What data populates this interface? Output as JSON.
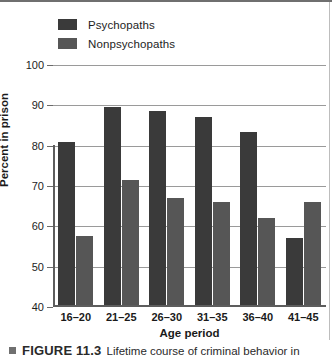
{
  "legend": {
    "items": [
      {
        "label": "Psychopaths",
        "color": "#3a3a3a",
        "icon": "legend-swatch-icon"
      },
      {
        "label": "Nonpsychopaths",
        "color": "#565656",
        "icon": "legend-swatch-icon"
      }
    ]
  },
  "caption": {
    "figure_number": "FIGURE 11.3",
    "text": "Lifetime course of criminal behavior in",
    "bullet_icon": "square-bullet-icon"
  },
  "chart_data": {
    "type": "bar",
    "title": "",
    "xlabel": "Age period",
    "ylabel": "Percent in prison",
    "categories": [
      "16–20",
      "21–25",
      "26–30",
      "31–35",
      "36–40",
      "41–45"
    ],
    "series": [
      {
        "name": "Psychopaths",
        "color": "#3a3a3a",
        "values": [
          81,
          89.5,
          88.5,
          87,
          83.5,
          57
        ]
      },
      {
        "name": "Nonpsychopaths",
        "color": "#565656",
        "values": [
          57.5,
          71.5,
          67,
          66,
          62,
          66
        ]
      }
    ],
    "ylim": [
      40,
      100
    ],
    "yticks": [
      40,
      50,
      60,
      70,
      80,
      90,
      100
    ],
    "ytick_labels": [
      "40",
      "50",
      "60",
      "70",
      "80",
      "90",
      "100"
    ],
    "grid": true,
    "legend_position": "top-left"
  }
}
